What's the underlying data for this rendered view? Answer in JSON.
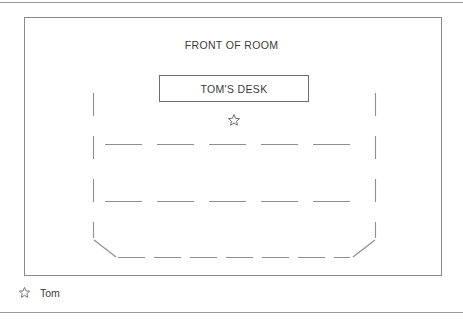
{
  "diagram": {
    "title": "FRONT OF ROOM",
    "desk_label": "TOM'S DESK",
    "marker_icon": "star-icon",
    "line_color": "#8a8a8a",
    "dash_color": "#8f8f8f",
    "text_color": "#3c3c3c",
    "background": "#ffffff"
  },
  "legend": {
    "icon": "star-icon",
    "label": "Tom"
  },
  "seating": {
    "row_count": 3,
    "side_wall_count": 2,
    "chamfered_corners": 2,
    "rows": [
      {
        "name": "row-1",
        "dashes": 5
      },
      {
        "name": "row-2",
        "dashes": 5
      },
      {
        "name": "row-3",
        "dashes": 7
      }
    ]
  }
}
